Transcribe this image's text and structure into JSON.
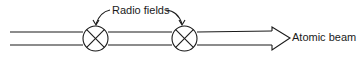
{
  "diagram": {
    "labels": {
      "radio_fields": "Radio fields",
      "atomic_beam": "Atomic beam"
    },
    "elements": [
      {
        "type": "beam-tube",
        "description": "two parallel horizontal lines forming a beam path ending in an arrow head"
      },
      {
        "type": "radio-field",
        "symbol": "circle-with-x",
        "index": 1
      },
      {
        "type": "radio-field",
        "symbol": "circle-with-x",
        "index": 2
      }
    ],
    "colors": {
      "line": "#1a1a1a",
      "background": "#ffffff"
    }
  }
}
